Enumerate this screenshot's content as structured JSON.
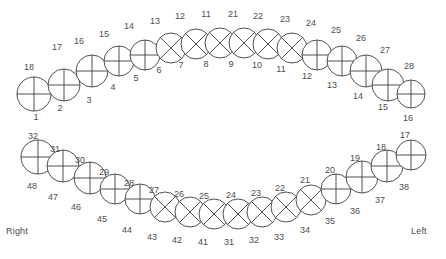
{
  "chart_data": {
    "type": "diagram",
    "subtitle": "Two arches with per-tooth quadrant surface shading",
    "legend_position": "none",
    "grid": false,
    "orientation_labels": {
      "right": "Right",
      "left": "Left"
    },
    "notation": {
      "outer": "FDI/alternate tooth number",
      "inner": "Universal tooth number"
    },
    "colors": {
      "outline": "#3d3d3d",
      "text": "#4d4d4d",
      "fill_empty": "#ffffff",
      "fill_shaded": "#8c8c8c",
      "background": "#ffffff"
    },
    "arches": [
      {
        "name": "upper",
        "teeth": [
          {
            "outer": "18",
            "inner": "1",
            "cross": "plus",
            "shaded": [
              "left"
            ]
          },
          {
            "outer": "17",
            "inner": "2",
            "cross": "plus",
            "shaded": []
          },
          {
            "outer": "16",
            "inner": "3",
            "cross": "plus",
            "shaded": [
              "top"
            ]
          },
          {
            "outer": "15",
            "inner": "4",
            "cross": "plus",
            "shaded": []
          },
          {
            "outer": "14",
            "inner": "5",
            "cross": "plus",
            "shaded": []
          },
          {
            "outer": "13",
            "inner": "6",
            "cross": "x",
            "shaded": []
          },
          {
            "outer": "12",
            "inner": "7",
            "cross": "x",
            "shaded": []
          },
          {
            "outer": "11",
            "inner": "8",
            "cross": "x",
            "shaded": []
          },
          {
            "outer": "21",
            "inner": "9",
            "cross": "x",
            "shaded": []
          },
          {
            "outer": "22",
            "inner": "10",
            "cross": "x",
            "shaded": []
          },
          {
            "outer": "23",
            "inner": "11",
            "cross": "x",
            "shaded": []
          },
          {
            "outer": "24",
            "inner": "12",
            "cross": "plus",
            "shaded": []
          },
          {
            "outer": "25",
            "inner": "13",
            "cross": "plus",
            "shaded": []
          },
          {
            "outer": "26",
            "inner": "14",
            "cross": "plus",
            "shaded": []
          },
          {
            "outer": "27",
            "inner": "15",
            "cross": "plus",
            "shaded": []
          },
          {
            "outer": "28",
            "inner": "16",
            "cross": "plus",
            "shaded": []
          }
        ]
      },
      {
        "name": "lower",
        "teeth": [
          {
            "outer": "32",
            "inner": "48",
            "cross": "plus",
            "shaded": [
              "left",
              "bottom"
            ]
          },
          {
            "outer": "31",
            "inner": "47",
            "cross": "plus",
            "shaded": [
              "left",
              "bottom"
            ]
          },
          {
            "outer": "30",
            "inner": "46",
            "cross": "plus",
            "shaded": []
          },
          {
            "outer": "29",
            "inner": "45",
            "cross": "plus",
            "shaded": []
          },
          {
            "outer": "28",
            "inner": "44",
            "cross": "plus",
            "shaded": [
              "right"
            ]
          },
          {
            "outer": "27",
            "inner": "43",
            "cross": "x",
            "shaded": []
          },
          {
            "outer": "26",
            "inner": "42",
            "cross": "x",
            "shaded": []
          },
          {
            "outer": "25",
            "inner": "41",
            "cross": "x",
            "shaded": [
              "bottom"
            ]
          },
          {
            "outer": "24",
            "inner": "31",
            "cross": "x",
            "shaded": [
              "bottom"
            ]
          },
          {
            "outer": "23",
            "inner": "32",
            "cross": "x",
            "shaded": [
              "bottom"
            ]
          },
          {
            "outer": "22",
            "inner": "33",
            "cross": "x",
            "shaded": []
          },
          {
            "outer": "21",
            "inner": "34",
            "cross": "x",
            "shaded": []
          },
          {
            "outer": "20",
            "inner": "35",
            "cross": "plus",
            "shaded": []
          },
          {
            "outer": "19",
            "inner": "36",
            "cross": "plus",
            "shaded": []
          },
          {
            "outer": "18",
            "inner": "37",
            "cross": "plus",
            "shaded": []
          },
          {
            "outer": "17",
            "inner": "38",
            "cross": "plus",
            "shaded": [
              "right"
            ]
          }
        ]
      }
    ],
    "geometry": {
      "upper": {
        "cx": [
          34,
          64,
          92,
          119,
          145,
          171,
          196,
          220,
          244,
          268,
          292,
          317,
          342,
          366,
          388,
          411
        ],
        "cy": [
          94,
          85,
          71,
          61,
          55,
          48,
          44,
          43,
          43,
          44,
          48,
          55,
          61,
          71,
          85,
          94
        ],
        "r": [
          17,
          16,
          16,
          15,
          15,
          15,
          15,
          15,
          15,
          15,
          15,
          15,
          15,
          16,
          16,
          14
        ],
        "outer_label": [
          {
            "x": 29,
            "y": 70
          },
          {
            "x": 57,
            "y": 50
          },
          {
            "x": 79,
            "y": 44
          },
          {
            "x": 104,
            "y": 37
          },
          {
            "x": 129,
            "y": 29
          },
          {
            "x": 155,
            "y": 24
          },
          {
            "x": 180,
            "y": 19
          },
          {
            "x": 206,
            "y": 17
          },
          {
            "x": 233,
            "y": 17
          },
          {
            "x": 258,
            "y": 19
          },
          {
            "x": 285,
            "y": 22
          },
          {
            "x": 311,
            "y": 26
          },
          {
            "x": 336,
            "y": 33
          },
          {
            "x": 361,
            "y": 41
          },
          {
            "x": 385,
            "y": 53
          },
          {
            "x": 409,
            "y": 69
          }
        ],
        "inner_label": [
          {
            "x": 36,
            "y": 120
          },
          {
            "x": 60,
            "y": 111
          },
          {
            "x": 89,
            "y": 103
          },
          {
            "x": 113,
            "y": 90
          },
          {
            "x": 136,
            "y": 81
          },
          {
            "x": 159,
            "y": 73
          },
          {
            "x": 181,
            "y": 68
          },
          {
            "x": 206,
            "y": 67
          },
          {
            "x": 231,
            "y": 67
          },
          {
            "x": 257,
            "y": 68
          },
          {
            "x": 281,
            "y": 72
          },
          {
            "x": 307,
            "y": 79
          },
          {
            "x": 332,
            "y": 88
          },
          {
            "x": 358,
            "y": 99
          },
          {
            "x": 383,
            "y": 110
          },
          {
            "x": 408,
            "y": 121
          }
        ]
      },
      "lower": {
        "cx": [
          38,
          63,
          90,
          115,
          140,
          165,
          190,
          214,
          238,
          262,
          286,
          311,
          336,
          362,
          387,
          411
        ],
        "cy": [
          157,
          166,
          178,
          189,
          199,
          207,
          212,
          214,
          214,
          212,
          207,
          200,
          189,
          177,
          166,
          155
        ],
        "r": [
          17,
          16,
          16,
          15,
          15,
          15,
          15,
          15,
          15,
          15,
          15,
          15,
          15,
          16,
          16,
          15
        ],
        "outer_label": [
          {
            "x": 33,
            "y": 139
          },
          {
            "x": 55,
            "y": 152
          },
          {
            "x": 80,
            "y": 163
          },
          {
            "x": 104,
            "y": 175
          },
          {
            "x": 129,
            "y": 186
          },
          {
            "x": 154,
            "y": 193
          },
          {
            "x": 179,
            "y": 197
          },
          {
            "x": 204,
            "y": 199
          },
          {
            "x": 231,
            "y": 198
          },
          {
            "x": 256,
            "y": 196
          },
          {
            "x": 280,
            "y": 191
          },
          {
            "x": 305,
            "y": 183
          },
          {
            "x": 330,
            "y": 173
          },
          {
            "x": 355,
            "y": 161
          },
          {
            "x": 381,
            "y": 150
          },
          {
            "x": 405,
            "y": 138
          }
        ],
        "inner_label": [
          {
            "x": 32,
            "y": 189
          },
          {
            "x": 53,
            "y": 200
          },
          {
            "x": 76,
            "y": 210
          },
          {
            "x": 102,
            "y": 222
          },
          {
            "x": 127,
            "y": 233
          },
          {
            "x": 152,
            "y": 240
          },
          {
            "x": 177,
            "y": 243
          },
          {
            "x": 203,
            "y": 245
          },
          {
            "x": 229,
            "y": 245
          },
          {
            "x": 254,
            "y": 243
          },
          {
            "x": 279,
            "y": 240
          },
          {
            "x": 305,
            "y": 233
          },
          {
            "x": 330,
            "y": 224
          },
          {
            "x": 355,
            "y": 214
          },
          {
            "x": 380,
            "y": 203
          },
          {
            "x": 404,
            "y": 190
          }
        ]
      }
    }
  }
}
